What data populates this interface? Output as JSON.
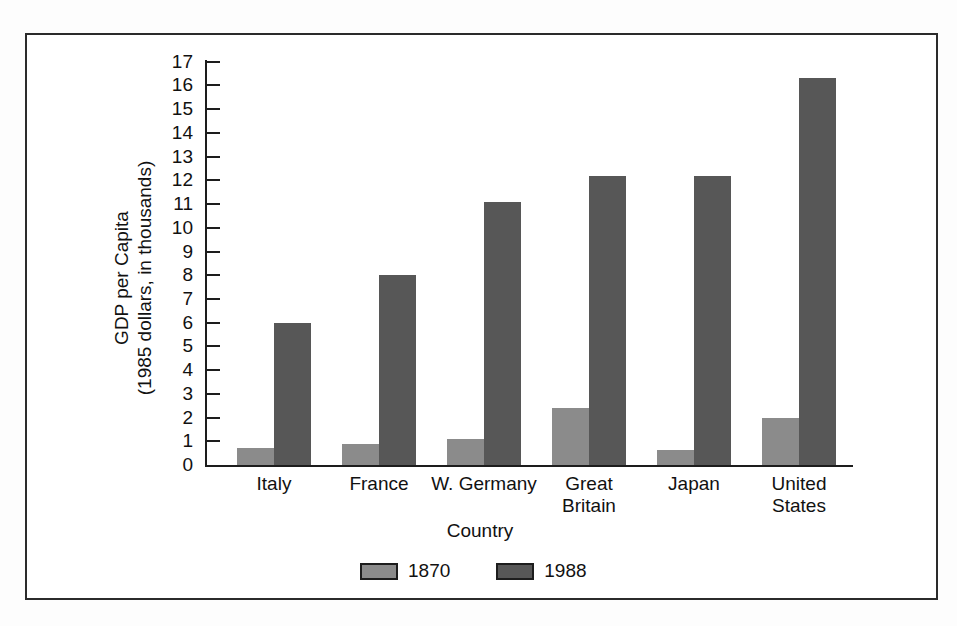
{
  "chart_data": {
    "type": "bar",
    "title": "",
    "xlabel": "Country",
    "ylabel": "GDP per Capita (1985 dollars, in thousands)",
    "ylabel_line1": "GDP per Capita",
    "ylabel_line2": "(1985 dollars, in thousands)",
    "categories": [
      "Italy",
      "France",
      "W. Germany",
      "Great Britain",
      "Japan",
      "United States"
    ],
    "category_lines": [
      [
        "Italy"
      ],
      [
        "France"
      ],
      [
        "W. Germany"
      ],
      [
        "Great",
        "Britain"
      ],
      [
        "Japan"
      ],
      [
        "United",
        "States"
      ]
    ],
    "series": [
      {
        "name": "1870",
        "color": "#8b8b8b",
        "values": [
          0.7,
          0.9,
          1.1,
          2.4,
          0.65,
          2.0
        ]
      },
      {
        "name": "1988",
        "color": "#575757",
        "values": [
          6.0,
          8.0,
          11.1,
          12.2,
          12.2,
          16.3
        ]
      }
    ],
    "ylim": [
      0,
      17
    ],
    "ytick_labels": [
      "0",
      "1",
      "2",
      "3",
      "4",
      "5",
      "6",
      "7",
      "8",
      "9",
      "10",
      "11",
      "12",
      "13",
      "14",
      "15",
      "16",
      "17"
    ],
    "ytick_values": [
      0,
      1,
      2,
      3,
      4,
      5,
      6,
      7,
      8,
      9,
      10,
      11,
      12,
      13,
      14,
      15,
      16,
      17
    ],
    "grid": false,
    "legend_position": "bottom-center"
  },
  "legend": {
    "items": [
      {
        "label": "1870",
        "color": "#8b8b8b"
      },
      {
        "label": "1988",
        "color": "#575757"
      }
    ]
  },
  "axes": {
    "x_title": "Country",
    "y_title_line1": "GDP per Capita",
    "y_title_line2": "(1985 dollars, in thousands)"
  }
}
